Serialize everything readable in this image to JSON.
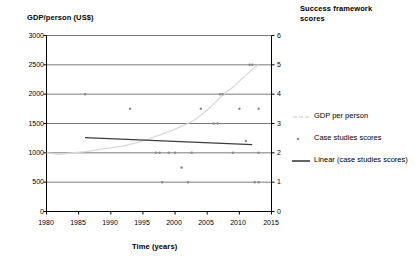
{
  "chart_data": {
    "type": "scatter",
    "title": "",
    "xlabel": "Time (years)",
    "ylabel": "GDP/person (US$)",
    "ylabel_right": "Success framework scores",
    "xlim": [
      1980,
      2015
    ],
    "ylim": [
      0,
      3000
    ],
    "ylim_right": [
      0,
      6
    ],
    "xticks": [
      1980,
      1985,
      1990,
      1995,
      2000,
      2005,
      2010,
      2015
    ],
    "yticks": [
      0,
      500,
      1000,
      1500,
      2000,
      2500,
      3000
    ],
    "yticks_right": [
      0,
      1,
      2,
      3,
      4,
      5,
      6
    ],
    "grid": true,
    "legend_position": "right",
    "series": [
      {
        "name": "GDP per person",
        "type": "line",
        "axis": "left",
        "color": "#d9d9d9",
        "points": [
          [
            1980,
            1000
          ],
          [
            1981,
            985
          ],
          [
            1982,
            975
          ],
          [
            1983,
            985
          ],
          [
            1984,
            1000
          ],
          [
            1985,
            1010
          ],
          [
            1986,
            1020
          ],
          [
            1987,
            1035
          ],
          [
            1988,
            1055
          ],
          [
            1989,
            1070
          ],
          [
            1990,
            1085
          ],
          [
            1991,
            1100
          ],
          [
            1992,
            1120
          ],
          [
            1993,
            1145
          ],
          [
            1994,
            1175
          ],
          [
            1995,
            1205
          ],
          [
            1996,
            1240
          ],
          [
            1997,
            1280
          ],
          [
            1998,
            1320
          ],
          [
            1999,
            1360
          ],
          [
            2000,
            1405
          ],
          [
            2001,
            1450
          ],
          [
            2002,
            1500
          ],
          [
            2003,
            1560
          ],
          [
            2004,
            1640
          ],
          [
            2005,
            1730
          ],
          [
            2006,
            1830
          ],
          [
            2007,
            1940
          ],
          [
            2008,
            2040
          ],
          [
            2009,
            2120
          ],
          [
            2010,
            2220
          ],
          [
            2011,
            2320
          ],
          [
            2012,
            2420
          ],
          [
            2013,
            2500
          ]
        ]
      },
      {
        "name": "Case studies scores",
        "type": "scatter",
        "axis": "right",
        "color": "#8c8c8c",
        "points": [
          [
            1986,
            4
          ],
          [
            1993,
            3.5
          ],
          [
            1997,
            2
          ],
          [
            1997.6,
            2
          ],
          [
            1998,
            1
          ],
          [
            1999,
            2
          ],
          [
            2000,
            2
          ],
          [
            2001,
            1.5
          ],
          [
            2002,
            1
          ],
          [
            2002.6,
            2
          ],
          [
            2004,
            3.5
          ],
          [
            2006,
            3
          ],
          [
            2006.6,
            3
          ],
          [
            2007,
            4
          ],
          [
            2007.4,
            4
          ],
          [
            2009,
            2
          ],
          [
            2010,
            3.5
          ],
          [
            2011,
            2.4
          ],
          [
            2011.6,
            5
          ],
          [
            2012,
            5
          ],
          [
            2012.4,
            1
          ],
          [
            2013,
            1
          ],
          [
            2013,
            3.5
          ],
          [
            2013,
            2
          ]
        ]
      },
      {
        "name": "Linear (case studies scores)",
        "type": "line",
        "axis": "right",
        "color": "#3c3c3c",
        "points": [
          [
            1986,
            2.52
          ],
          [
            2012,
            2.28
          ]
        ]
      }
    ],
    "legend": [
      {
        "label": "GDP per person",
        "marker": "dashed-line",
        "color": "#d9d9d9"
      },
      {
        "label": "Case studies scores",
        "marker": "dot",
        "color": "#8c8c8c"
      },
      {
        "label": "Linear (case studies scores)",
        "marker": "solid-line",
        "color": "#3c3c3c"
      }
    ]
  },
  "axes": {
    "left_title": "GDP/person (US$)",
    "right_title": "Success framework scores",
    "x_title": "Time (years)",
    "left_ticks": [
      "3000",
      "2500",
      "2000",
      "1500",
      "1000",
      "500",
      "0"
    ],
    "right_ticks": [
      "6",
      "5",
      "4",
      "3",
      "2",
      "1",
      "0"
    ],
    "x_ticks": [
      "1980",
      "1985",
      "1990",
      "1995",
      "2000",
      "2005",
      "2010",
      "2015"
    ]
  },
  "legend": {
    "items": [
      {
        "label": "GDP per person"
      },
      {
        "label": "Case studies scores"
      },
      {
        "label": "Linear (case studies scores)"
      }
    ]
  },
  "colors": {
    "gdp_line": "#d9d9d9",
    "scatter": "#8c8c8c",
    "trend_line": "#3c3c3c",
    "axis": "#000000",
    "grid": "#595959"
  }
}
